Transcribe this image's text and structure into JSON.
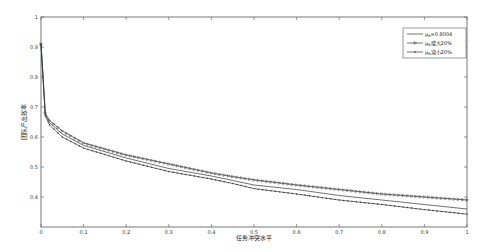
{
  "chart_data": {
    "type": "line",
    "title": "",
    "xlabel": "任务冲突水平",
    "ylabel": "团队产出效率",
    "xlim": [
      0,
      1
    ],
    "ylim": [
      0.3,
      1
    ],
    "x_ticks": [
      "0",
      "0.1",
      "0.2",
      "0.3",
      "0.4",
      "0.5",
      "0.6",
      "0.7",
      "0.8",
      "0.9",
      "1"
    ],
    "y_ticks": [
      "0.4",
      "0.5",
      "0.6",
      "0.7",
      "0.8",
      "0.9",
      "1"
    ],
    "grid": false,
    "legend_position": "upper right",
    "x": [
      0,
      0.01,
      0.02,
      0.05,
      0.1,
      0.2,
      0.3,
      0.4,
      0.45,
      0.5,
      0.6,
      0.7,
      0.8,
      0.9,
      1.0
    ],
    "series": [
      {
        "name": "μB=0.8004",
        "marker": "none",
        "values": [
          0.91,
          0.675,
          0.648,
          0.61,
          0.572,
          0.53,
          0.495,
          0.47,
          0.455,
          0.44,
          0.425,
          0.405,
          0.39,
          0.375,
          0.36
        ]
      },
      {
        "name": "μB增大20%",
        "marker": "triangle",
        "values": [
          0.91,
          0.68,
          0.655,
          0.62,
          0.58,
          0.54,
          0.51,
          0.48,
          0.468,
          0.457,
          0.44,
          0.425,
          0.41,
          0.4,
          0.39
        ]
      },
      {
        "name": "μB减小20%",
        "marker": "dot",
        "values": [
          0.91,
          0.67,
          0.64,
          0.6,
          0.563,
          0.52,
          0.485,
          0.46,
          0.445,
          0.428,
          0.41,
          0.39,
          0.375,
          0.358,
          0.343
        ]
      }
    ]
  },
  "legend": {
    "items": [
      {
        "prefix": "μ",
        "sub": "B",
        "suffix": "=0.8004"
      },
      {
        "prefix": "μ",
        "sub": "B",
        "suffix": "增大20%"
      },
      {
        "prefix": "μ",
        "sub": "B",
        "suffix": "减小20%"
      }
    ]
  }
}
